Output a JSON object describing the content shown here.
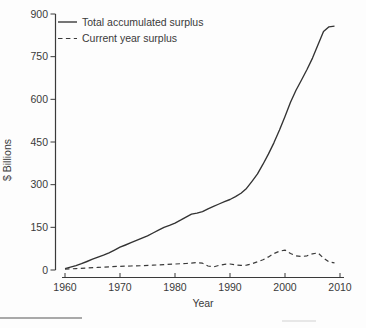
{
  "figure": {
    "accent_color": "#3a3a3a",
    "background_color": "#fdfdfd"
  },
  "chart_data": {
    "type": "line",
    "title": "",
    "xlabel": "Year",
    "ylabel": "$ Billions",
    "xlim": [
      1960,
      2010
    ],
    "ylim": [
      0,
      900
    ],
    "xticks": [
      1960,
      1970,
      1980,
      1990,
      2000,
      2010
    ],
    "yticks": [
      0,
      150,
      300,
      450,
      600,
      750,
      900
    ],
    "grid": false,
    "legend_position": "top-left",
    "series": [
      {
        "name": "Total accumulated surplus",
        "dash": "solid",
        "color": "#333333",
        "points": [
          [
            1960,
            5
          ],
          [
            1961,
            10
          ],
          [
            1962,
            15
          ],
          [
            1963,
            22
          ],
          [
            1964,
            30
          ],
          [
            1965,
            38
          ],
          [
            1966,
            45
          ],
          [
            1967,
            52
          ],
          [
            1968,
            60
          ],
          [
            1969,
            70
          ],
          [
            1970,
            80
          ],
          [
            1971,
            88
          ],
          [
            1972,
            96
          ],
          [
            1973,
            104
          ],
          [
            1974,
            112
          ],
          [
            1975,
            120
          ],
          [
            1976,
            130
          ],
          [
            1977,
            140
          ],
          [
            1978,
            150
          ],
          [
            1979,
            157
          ],
          [
            1980,
            165
          ],
          [
            1981,
            175
          ],
          [
            1982,
            186
          ],
          [
            1983,
            196
          ],
          [
            1984,
            200
          ],
          [
            1985,
            205
          ],
          [
            1986,
            215
          ],
          [
            1987,
            224
          ],
          [
            1988,
            232
          ],
          [
            1989,
            240
          ],
          [
            1990,
            248
          ],
          [
            1991,
            258
          ],
          [
            1992,
            270
          ],
          [
            1993,
            287
          ],
          [
            1994,
            312
          ],
          [
            1995,
            338
          ],
          [
            1996,
            372
          ],
          [
            1997,
            408
          ],
          [
            1998,
            448
          ],
          [
            1999,
            492
          ],
          [
            2000,
            540
          ],
          [
            2001,
            590
          ],
          [
            2002,
            632
          ],
          [
            2003,
            668
          ],
          [
            2004,
            705
          ],
          [
            2005,
            745
          ],
          [
            2006,
            792
          ],
          [
            2007,
            838
          ],
          [
            2008,
            855
          ],
          [
            2009,
            857
          ]
        ]
      },
      {
        "name": "Current year surplus",
        "dash": "dashed",
        "color": "#3a3a3a",
        "points": [
          [
            1960,
            3
          ],
          [
            1962,
            5
          ],
          [
            1964,
            7
          ],
          [
            1966,
            9
          ],
          [
            1968,
            11
          ],
          [
            1970,
            13
          ],
          [
            1972,
            14
          ],
          [
            1974,
            15
          ],
          [
            1976,
            17
          ],
          [
            1978,
            19
          ],
          [
            1980,
            21
          ],
          [
            1982,
            23
          ],
          [
            1984,
            26
          ],
          [
            1985,
            24
          ],
          [
            1986,
            14
          ],
          [
            1987,
            11
          ],
          [
            1988,
            16
          ],
          [
            1989,
            20
          ],
          [
            1990,
            21
          ],
          [
            1991,
            18
          ],
          [
            1992,
            16
          ],
          [
            1993,
            17
          ],
          [
            1994,
            22
          ],
          [
            1995,
            29
          ],
          [
            1996,
            36
          ],
          [
            1997,
            46
          ],
          [
            1998,
            58
          ],
          [
            1999,
            66
          ],
          [
            2000,
            70
          ],
          [
            2001,
            58
          ],
          [
            2002,
            50
          ],
          [
            2003,
            47
          ],
          [
            2004,
            50
          ],
          [
            2005,
            57
          ],
          [
            2006,
            60
          ],
          [
            2007,
            42
          ],
          [
            2008,
            28
          ],
          [
            2009,
            25
          ]
        ]
      }
    ]
  }
}
